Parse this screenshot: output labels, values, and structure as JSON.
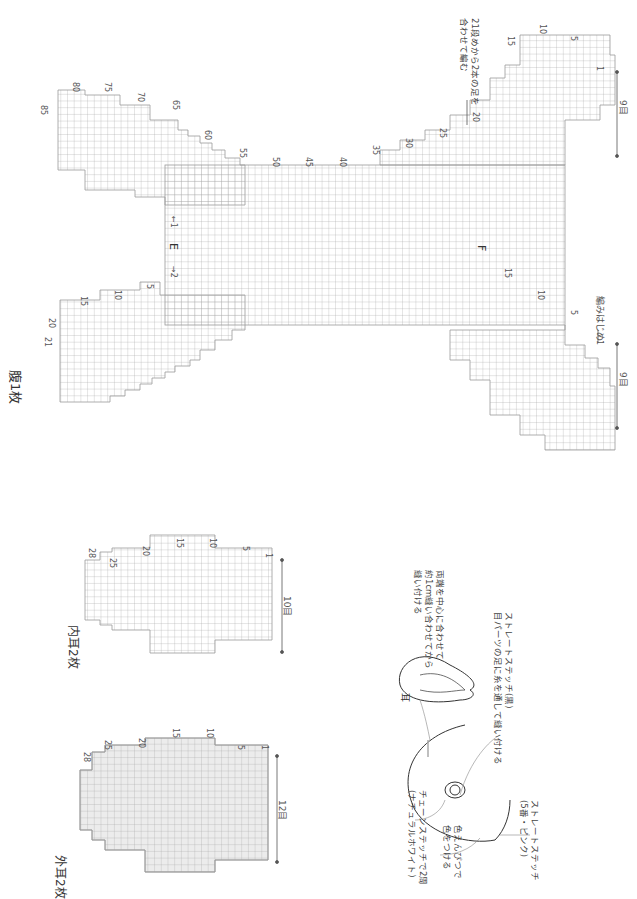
{
  "page": {
    "orientation": "rotated 90deg clockwise",
    "line_color": "#9a9a9a",
    "text_color": "#333333",
    "fill_gray": "#ebebeb"
  },
  "belly_chart": {
    "title": "腹1枚",
    "upper_left_lobe_row_numbers": [
      "21",
      "20",
      "15",
      "10",
      "5"
    ],
    "upper_right_lobe_row_numbers": [
      "85",
      "80",
      "75",
      "70",
      "65",
      "60",
      "55"
    ],
    "center_row_numbers": [
      "50",
      "45",
      "40",
      "35",
      "30",
      "25",
      "20"
    ],
    "lower_left_lobe_row_numbers": [
      "15",
      "10",
      "5",
      "1"
    ],
    "lower_right_lobe_row_numbers": [
      "15",
      "10",
      "5",
      "1"
    ],
    "marker_e": "E",
    "marker_f": "F",
    "marker_arrow_1": "←1",
    "marker_arrow_2": "→2",
    "width_label_left": "9目",
    "width_label_right": "9目",
    "start_label": "編みはじめ",
    "note": "21段めから2本の足を\n合わせて編む"
  },
  "inner_ear_chart": {
    "title": "内耳2枚",
    "row_numbers": [
      "28",
      "25",
      "20",
      "15",
      "10",
      "5",
      "1"
    ],
    "width_label": "10目"
  },
  "outer_ear_chart": {
    "title": "外耳2枚",
    "row_numbers": [
      "28",
      "25",
      "20",
      "15",
      "10",
      "5",
      "1"
    ],
    "width_label": "12目"
  },
  "face_diagram": {
    "ear_label": "耳",
    "ear_note": "両端を中心に合わせて\n約1cm縫い合わせてから\n縫い付ける",
    "eye_note": "ストレートステッチ(黒)\n目パーツの足に糸を通して縫い付ける",
    "chain_note": "チェーンステッチで2周\n(ナチュラルホワイト)",
    "cheek_note": "色えんぴつで\n色をつける",
    "nose_note": "ストレートステッチ\n(5番・ピンク)"
  }
}
